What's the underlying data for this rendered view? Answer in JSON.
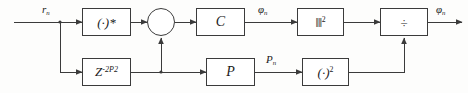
{
  "diagram": {
    "width": 468,
    "height": 93,
    "line_color": "#3b3b3b",
    "text_color": "#1a1a1a",
    "background": "#fdfdfc"
  },
  "signals": {
    "input": "r",
    "input_sub": "n",
    "top_mid": "φ",
    "top_mid_sub": "n",
    "bottom_mid": "P",
    "bottom_mid_sub": "n",
    "output": "φ",
    "output_sub": "n"
  },
  "blocks": {
    "conjugate": {
      "label": "(·)*",
      "name": "complex-conjugate"
    },
    "mixer": {
      "label": "⊗",
      "name": "multiplier"
    },
    "gain_c": {
      "label": "C",
      "name": "correlator"
    },
    "norm_squared": {
      "base": "‖‖",
      "exp": "2",
      "name": "magnitude-squared"
    },
    "divider": {
      "label": "÷",
      "name": "divide"
    },
    "delay": {
      "base": "Z",
      "exp": "-2P2",
      "name": "delay"
    },
    "power_p": {
      "label": "P",
      "name": "power-estimator"
    },
    "square": {
      "base": "(·)",
      "exp": "2",
      "name": "square"
    }
  }
}
